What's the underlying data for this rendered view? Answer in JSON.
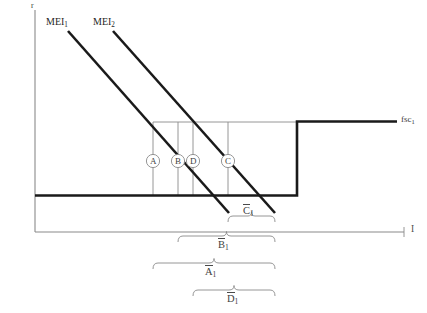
{
  "figure": {
    "axes": {
      "y_label": "r",
      "x_label": "I",
      "y_axis_color": "#8c8c8c",
      "x_axis_color": "#8c8c8c"
    },
    "curves": {
      "mei1_label": "MEI",
      "mei1_sub": "1",
      "mei2_label": "MEI",
      "mei2_sub": "2",
      "fsc_label": "fsc",
      "fsc_sub": "1",
      "curve_color": "#1a1a1a"
    },
    "points": [
      {
        "id": "point-a",
        "letter": "A",
        "x": 153,
        "y": 161
      },
      {
        "id": "point-b",
        "letter": "B",
        "x": 178,
        "y": 161
      },
      {
        "id": "point-d",
        "letter": "D",
        "x": 193,
        "y": 161
      },
      {
        "id": "point-c",
        "letter": "C",
        "x": 228,
        "y": 161
      }
    ],
    "braces": [
      {
        "id": "brace-c",
        "label": "C",
        "sub": "1",
        "x_start": 228,
        "x_end": 275,
        "label_x": 243,
        "label_y": 206
      },
      {
        "id": "brace-b",
        "label": "B",
        "sub": "1",
        "x_start": 178,
        "x_end": 275,
        "label_x": 218,
        "label_y": 240
      },
      {
        "id": "brace-a",
        "label": "A",
        "sub": "1",
        "x_start": 153,
        "x_end": 275,
        "label_x": 205,
        "label_y": 267
      },
      {
        "id": "brace-d",
        "label": "D",
        "sub": "1",
        "x_start": 193,
        "x_end": 275,
        "label_x": 227,
        "label_y": 294
      }
    ],
    "colors": {
      "background": "#ffffff",
      "grid_line": "#8a8a8a",
      "heavy_line": "#1a1a1a",
      "brace_line": "#8a8a8a",
      "text": "#2b2b2b"
    }
  }
}
